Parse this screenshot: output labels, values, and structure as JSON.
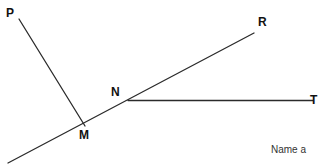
{
  "figure": {
    "type": "geometry-line-diagram",
    "background_color": "#ffffff",
    "stroke_color": "#2b2b2b",
    "label_color": "#111111",
    "points": [
      {
        "id": "P",
        "label": "P",
        "x": 19,
        "y": 19
      },
      {
        "id": "M",
        "label": "M",
        "x": 85,
        "y": 126
      },
      {
        "id": "N",
        "label": "N",
        "x": 128,
        "y": 101
      },
      {
        "id": "R",
        "label": "R",
        "x": 254,
        "y": 33
      },
      {
        "id": "T",
        "label": "T",
        "x": 311,
        "y": 101
      }
    ],
    "segments": [
      {
        "id": "ray-p-m",
        "name": "ray PM",
        "from": "P",
        "to": "M",
        "x1": 19,
        "y1": 19,
        "x2": 85,
        "y2": 126
      },
      {
        "id": "line-mr",
        "name": "line through M N R",
        "x1": 8,
        "y1": 163,
        "x2": 254,
        "y2": 33
      },
      {
        "id": "ray-n-t",
        "name": "ray NT",
        "from": "N",
        "to": "T",
        "x1": 128,
        "y1": 101,
        "x2": 311,
        "y2": 101
      }
    ]
  },
  "caption": {
    "text": "Name a"
  }
}
